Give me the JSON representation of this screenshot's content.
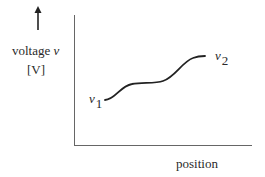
{
  "diagram": {
    "y_axis": {
      "label": "voltage",
      "symbol": "v",
      "unit": "[V]",
      "arrow": "up-arrow"
    },
    "x_axis": {
      "label": "position"
    },
    "curve": {
      "start_label": {
        "symbol": "v",
        "subscript": "1"
      },
      "end_label": {
        "symbol": "v",
        "subscript": "2"
      },
      "shape": "monotonic increasing S-curve with plateau"
    },
    "colors": {
      "stroke": "#222222",
      "axis": "#555555",
      "background": "#ffffff"
    }
  }
}
